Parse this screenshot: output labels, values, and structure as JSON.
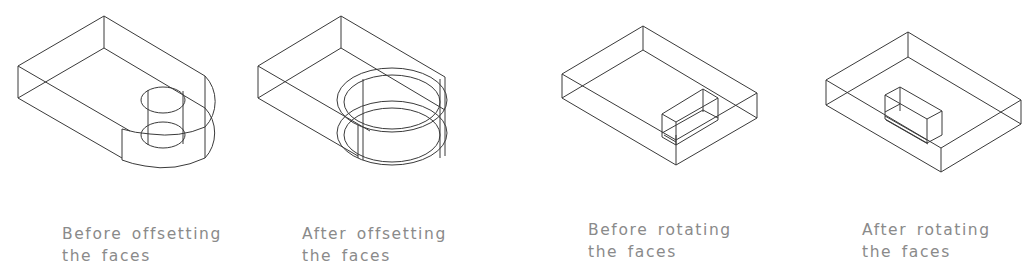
{
  "figures": [
    {
      "id": "before-offsetting",
      "caption": {
        "line1": "Before offsetting",
        "line2": "the faces"
      }
    },
    {
      "id": "after-offsetting",
      "caption": {
        "line1": "After offsetting",
        "line2": "the faces"
      }
    },
    {
      "id": "before-rotating",
      "caption": {
        "line1": "Before rotating",
        "line2": "the faces"
      }
    },
    {
      "id": "after-rotating",
      "caption": {
        "line1": "After rotating",
        "line2": "the faces"
      }
    }
  ],
  "colors": {
    "line": "#3a3a3a",
    "caption_text": "#8a8a8a",
    "background": "#ffffff"
  }
}
